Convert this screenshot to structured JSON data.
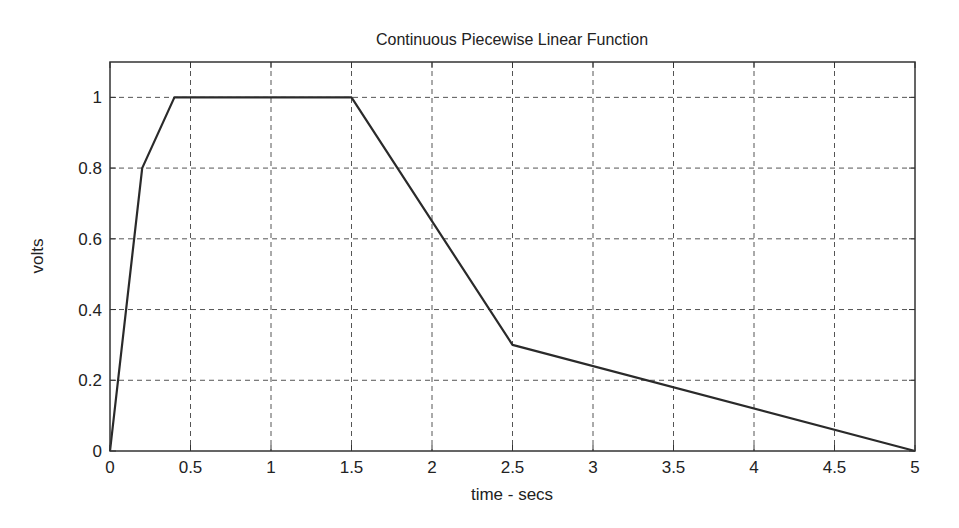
{
  "chart_data": {
    "type": "line",
    "title": "Continuous Piecewise Linear Function",
    "xlabel": "time - secs",
    "ylabel": "volts",
    "xlim": [
      0,
      5
    ],
    "ylim": [
      0,
      1.1
    ],
    "grid": true,
    "x_ticks": [
      0,
      0.5,
      1,
      1.5,
      2,
      2.5,
      3,
      3.5,
      4,
      4.5,
      5
    ],
    "x_tick_labels": [
      "0",
      "0.5",
      "1",
      "1.5",
      "2",
      "2.5",
      "3",
      "3.5",
      "4",
      "4.5",
      "5"
    ],
    "y_ticks": [
      0,
      0.2,
      0.4,
      0.6,
      0.8,
      1
    ],
    "y_tick_labels": [
      "0",
      "0.2",
      "0.4",
      "0.6",
      "0.8",
      "1"
    ],
    "series": [
      {
        "name": "v(t)",
        "color": "#2a2a2a",
        "x": [
          0,
          0.2,
          0.4,
          1.5,
          2.5,
          5
        ],
        "y": [
          0,
          0.8,
          1,
          1,
          0.3,
          0
        ]
      }
    ]
  }
}
